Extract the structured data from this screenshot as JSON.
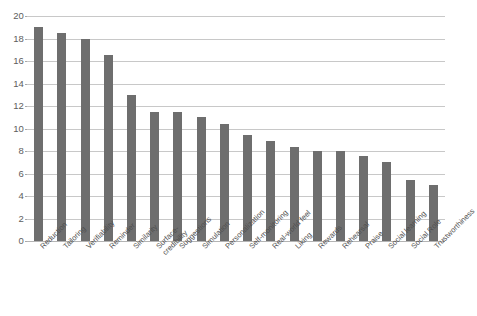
{
  "chart_data": {
    "type": "bar",
    "title": "",
    "subtitle": "",
    "xlabel": "",
    "ylabel": "",
    "ylim": [
      0,
      20
    ],
    "ytick_step": 2,
    "yticks": [
      0,
      2,
      4,
      6,
      8,
      10,
      12,
      14,
      16,
      18,
      20
    ],
    "ytick_labels": [
      "0",
      "2",
      "4",
      "6",
      "8",
      "10",
      "12",
      "14",
      "16",
      "18",
      "20"
    ],
    "grid": "horizontal",
    "legend": "none",
    "bar_color": "#6e6e6e",
    "gridline_color": "#c8c8c8",
    "categories": [
      "Reduction",
      "Tailoring",
      "Verifiability",
      "Reminder",
      "Similarity",
      "Surface-credibility",
      "Suggestions",
      "Simulation",
      "Personalization",
      "Self-monitoring",
      "Real-world feel",
      "Liking",
      "Rewards",
      "Rehearsal",
      "Praise",
      "Social learning",
      "Social Role",
      "Trustworthiness"
    ],
    "values": [
      19,
      18.5,
      18,
      16.5,
      13,
      11.5,
      11.5,
      11,
      10.4,
      9.4,
      8.9,
      8.4,
      8,
      8,
      7.6,
      7,
      5.4,
      5
    ]
  },
  "axis": {
    "y_max_label": "20",
    "y_min_label": "0"
  }
}
